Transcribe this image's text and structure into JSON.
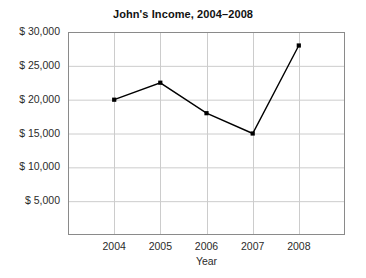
{
  "chart_data": {
    "type": "line",
    "title": "John's Income, 2004–2008",
    "xlabel": "Year",
    "ylabel": "",
    "categories": [
      "2004",
      "2005",
      "2006",
      "2007",
      "2008"
    ],
    "x": [
      2004,
      2005,
      2006,
      2007,
      2008
    ],
    "values": [
      20000,
      22500,
      18000,
      15000,
      28000
    ],
    "series": [
      {
        "name": "John's Income",
        "values": [
          20000,
          22500,
          18000,
          15000,
          28000
        ]
      }
    ],
    "ylim": [
      0,
      30000
    ],
    "y_tick_values": [
      5000,
      10000,
      15000,
      20000,
      25000,
      30000
    ],
    "y_tick_labels": [
      "$ 5,000",
      "$ 10,000",
      "$ 15,000",
      "$ 20,000",
      "$ 25,000",
      "$ 30,000"
    ],
    "x_tick_labels": [
      "2004",
      "2005",
      "2006",
      "2007",
      "2008"
    ],
    "grid": true,
    "legend": "none",
    "line_color": "#000000",
    "marker": "square",
    "marker_color": "#000000",
    "grid_color": "#cccccc",
    "frame_color": "#888888",
    "background_color": "#ffffff"
  }
}
